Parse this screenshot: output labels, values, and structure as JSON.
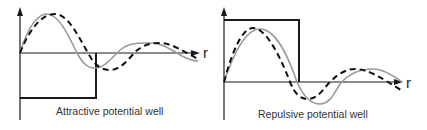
{
  "panels": [
    {
      "id": "attractive",
      "caption": "Attractive potential well",
      "axis_label": "r",
      "well_type": "attractive",
      "curves": [
        {
          "name": "free-wavefunction",
          "style": "solid",
          "color": "#9a9a9a"
        },
        {
          "name": "scattered-wavefunction",
          "style": "dashed",
          "color": "#111111"
        }
      ]
    },
    {
      "id": "repulsive",
      "caption": "Repulsive potential well",
      "axis_label": "r",
      "well_type": "repulsive",
      "curves": [
        {
          "name": "free-wavefunction",
          "style": "solid",
          "color": "#9a9a9a"
        },
        {
          "name": "scattered-wavefunction",
          "style": "dashed",
          "color": "#111111"
        }
      ]
    }
  ],
  "colors": {
    "axis": "#1a1a1a",
    "solid_curve": "#9a9a9a",
    "dashed_curve": "#111111",
    "background": "#ffffff"
  }
}
